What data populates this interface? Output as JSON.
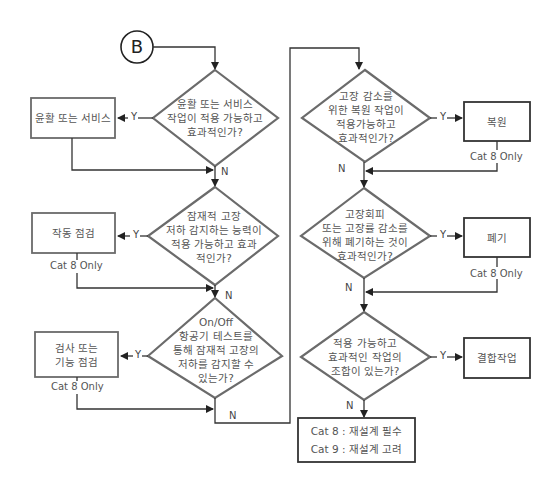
{
  "connector": {
    "label": "B"
  },
  "left_column": {
    "decisions": [
      {
        "text": "윤활 또는 서비스\n작업이 적용 가능하고\n효과적인가?",
        "yes": "Y",
        "no": "N"
      },
      {
        "text": "잠재적 고장\n저하 감지하는 능력이\n적용 가능하고 효과\n적인가?",
        "yes": "Y",
        "no": "N"
      },
      {
        "text": "On/Off\n항공기 테스트를\n통해 잠재적 고장의\n저하를 감지할 수\n있는가?",
        "yes": "Y",
        "no": "N"
      }
    ],
    "actions": [
      {
        "text": "윤활 또는 서비스",
        "note": ""
      },
      {
        "text": "작동 점검",
        "note": "Cat 8 Only"
      },
      {
        "text": "검사 또는\n기능 점검",
        "note": "Cat 8 Only"
      }
    ]
  },
  "right_column": {
    "decisions": [
      {
        "text": "고장 감소를\n위한 복원 작업이\n적용가능하고\n효과적인가?",
        "yes": "Y",
        "no": "N"
      },
      {
        "text": "고장회피\n또는 고장률 감소를\n위해 폐기하는 것이\n효과적인가?",
        "yes": "Y",
        "no": "N"
      },
      {
        "text": "적용 가능하고\n효과적인 작업의\n조합이 있는가?",
        "yes": "Y",
        "no": "N"
      }
    ],
    "actions": [
      {
        "text": "복원",
        "note": "Cat 8 Only"
      },
      {
        "text": "폐기",
        "note": "Cat 8 Only"
      },
      {
        "text": "결합작업",
        "note": ""
      }
    ]
  },
  "final_box": {
    "line1": "Cat 8 : 재설계 필수",
    "line2": "Cat 9 : 재설계 고려"
  },
  "colors": {
    "diamond_stroke": "#6b6b6b",
    "box_stroke": "#6b6b6b",
    "line": "#333333",
    "text": "#555555"
  }
}
